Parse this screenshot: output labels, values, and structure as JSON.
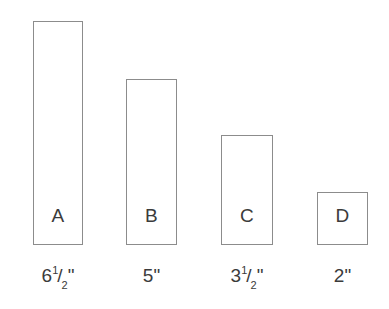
{
  "figure": {
    "background_color": "#ffffff",
    "stroke_color": "#8c8c8c",
    "text_color": "#3b3b3b",
    "baseline_y": 245,
    "scale_px_per_inch": 34.5
  },
  "chart_data": {
    "type": "bar",
    "title": "",
    "xlabel": "",
    "ylabel": "",
    "categories": [
      "A",
      "B",
      "C",
      "D"
    ],
    "values": [
      6.5,
      5,
      3.5,
      2
    ],
    "value_unit": "inch",
    "tick_labels": [
      "6 1/2\"",
      "5\"",
      "3 1/2\"",
      "2\""
    ],
    "grid": false,
    "legend": null,
    "ylim": [
      0,
      6.5
    ]
  },
  "bars": [
    {
      "letter": "A",
      "value": 6.5,
      "caption": {
        "whole": "6",
        "numerator": "1",
        "solidus": "/",
        "denominator": "2",
        "unit": "\"",
        "has_fraction": true
      },
      "geometry": {
        "left": 33,
        "width": 50,
        "top": 21,
        "height": 224
      }
    },
    {
      "letter": "B",
      "value": 5,
      "caption": {
        "whole": "5",
        "numerator": "",
        "solidus": "",
        "denominator": "",
        "unit": "\"",
        "has_fraction": false
      },
      "geometry": {
        "left": 126,
        "width": 51,
        "top": 79,
        "height": 166
      }
    },
    {
      "letter": "C",
      "value": 3.5,
      "caption": {
        "whole": "3",
        "numerator": "1",
        "solidus": "/",
        "denominator": "2",
        "unit": "\"",
        "has_fraction": true
      },
      "geometry": {
        "left": 221,
        "width": 52,
        "top": 135,
        "height": 110
      }
    },
    {
      "letter": "D",
      "value": 2,
      "caption": {
        "whole": "2",
        "numerator": "",
        "solidus": "",
        "denominator": "",
        "unit": "\"",
        "has_fraction": false
      },
      "geometry": {
        "left": 317,
        "width": 51,
        "top": 192,
        "height": 53
      }
    }
  ]
}
